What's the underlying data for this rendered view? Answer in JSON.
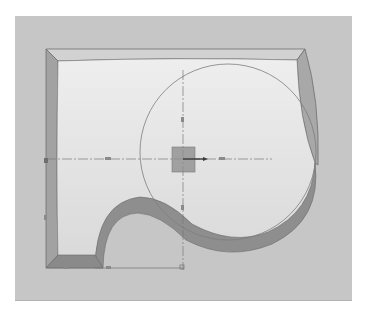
{
  "viewport": {
    "label": "3D model viewport",
    "background_color": "#c6c6c6",
    "model": {
      "type": "extruded-sketch-body",
      "top_face_color": "#e2e2e2",
      "side_face_color": "#9c9c9c",
      "edge_color": "#6e6e6e"
    },
    "sketch": {
      "circle": {
        "cx": 228,
        "cy": 152,
        "r": 88
      },
      "origin": {
        "x": 183,
        "y": 159
      },
      "origin_marker_color": "#8f8f8f",
      "axis_color": "#7a7a7a"
    }
  }
}
